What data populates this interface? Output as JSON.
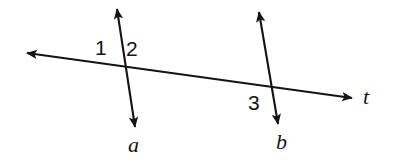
{
  "figure": {
    "background_color": "#ffffff",
    "stroke_color": "#141414",
    "width": 397,
    "height": 165,
    "angle_labels": [
      {
        "text": "1",
        "x": 95,
        "y": 37
      },
      {
        "text": "2",
        "x": 126,
        "y": 38
      },
      {
        "text": "3",
        "x": 248,
        "y": 92
      }
    ],
    "line_labels": [
      {
        "text": "a",
        "x": 128,
        "y": 134
      },
      {
        "text": "b",
        "x": 276,
        "y": 131
      },
      {
        "text": "t",
        "x": 363,
        "y": 86
      }
    ],
    "lines": [
      {
        "name": "line-a",
        "label": "a",
        "arrows": "both",
        "x1": 117,
        "y1": 9,
        "x2": 135,
        "y2": 127
      },
      {
        "name": "line-b",
        "label": "b",
        "arrows": "both",
        "x1": 259,
        "y1": 12,
        "x2": 278,
        "y2": 124
      },
      {
        "name": "line-t",
        "label": "t",
        "arrows": "both",
        "x1": 27,
        "y1": 53,
        "x2": 352,
        "y2": 98
      }
    ],
    "intersections": [
      {
        "name": "a-t",
        "x": 124,
        "y": 68
      },
      {
        "name": "b-t",
        "x": 272,
        "y": 89
      }
    ]
  }
}
